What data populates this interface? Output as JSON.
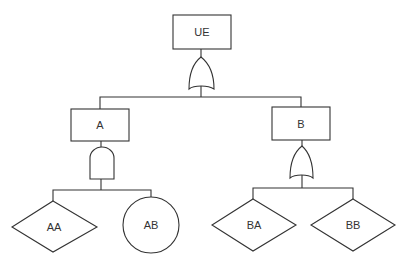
{
  "diagram": {
    "type": "fault-tree",
    "colors": {
      "stroke": "#333333",
      "background": "#ffffff",
      "text": "#333333"
    },
    "nodes": {
      "ue": {
        "label": "UE",
        "shape": "rectangle",
        "role": "top-event"
      },
      "a": {
        "label": "A",
        "shape": "rectangle",
        "role": "intermediate-event"
      },
      "b": {
        "label": "B",
        "shape": "rectangle",
        "role": "intermediate-event"
      },
      "aa": {
        "label": "AA",
        "shape": "diamond",
        "role": "undeveloped-event"
      },
      "ab": {
        "label": "AB",
        "shape": "circle",
        "role": "basic-event"
      },
      "ba": {
        "label": "BA",
        "shape": "diamond",
        "role": "undeveloped-event"
      },
      "bb": {
        "label": "BB",
        "shape": "diamond",
        "role": "undeveloped-event"
      }
    },
    "gates": {
      "ue_gate": {
        "type": "OR",
        "parent": "UE",
        "children": [
          "A",
          "B"
        ]
      },
      "a_gate": {
        "type": "AND",
        "parent": "A",
        "children": [
          "AA",
          "AB"
        ]
      },
      "b_gate": {
        "type": "OR",
        "parent": "B",
        "children": [
          "BA",
          "BB"
        ]
      }
    }
  }
}
